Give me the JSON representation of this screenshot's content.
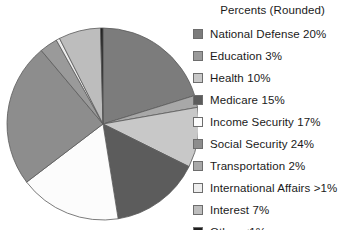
{
  "chart_data": {
    "type": "pie",
    "title": "Percents (Rounded)",
    "xlabel": "",
    "ylabel": "",
    "legend_position": "right",
    "grid": false,
    "start_angle_deg": 0,
    "direction": "clockwise",
    "categories": [
      "National Defense",
      "Education",
      "Health",
      "Medicare",
      "Income Security",
      "Social Security",
      "Transportation",
      "International Affairs",
      "Interest",
      "Other"
    ],
    "values": [
      20,
      3,
      10,
      15,
      17,
      24,
      2,
      0.6,
      7,
      0.4
    ],
    "value_labels": [
      "20%",
      "3%",
      "10%",
      "15%",
      "17%",
      "24%",
      "2%",
      ">1%",
      "7%",
      "<1%"
    ],
    "colors": [
      "#7c7c7c",
      "#9a9a9a",
      "#c8c8c8",
      "#5c5c5c",
      "#fcfcfc",
      "#8d8d8d",
      "#a8a8a8",
      "#ededed",
      "#bdbdbd",
      "#1e1e1e"
    ],
    "slice_order_clockwise": [
      {
        "name": "National Defense",
        "value": 20
      },
      {
        "name": "Transportation",
        "value": 2
      },
      {
        "name": "Health",
        "value": 10
      },
      {
        "name": "Medicare",
        "value": 15
      },
      {
        "name": "Income Security",
        "value": 17
      },
      {
        "name": "Social Security",
        "value": 24
      },
      {
        "name": "Education",
        "value": 3
      },
      {
        "name": "International Affairs",
        "value": 0.6
      },
      {
        "name": "Interest",
        "value": 7
      },
      {
        "name": "Other",
        "value": 0.4
      }
    ]
  },
  "legend": {
    "title": "Percents (Rounded)",
    "items": [
      {
        "label": "National Defense 20%",
        "color": "#7c7c7c"
      },
      {
        "label": "Education 3%",
        "color": "#9a9a9a"
      },
      {
        "label": "Health 10%",
        "color": "#c8c8c8"
      },
      {
        "label": "Medicare 15%",
        "color": "#5c5c5c"
      },
      {
        "label": "Income Security 17%",
        "color": "#fcfcfc"
      },
      {
        "label": "Social Security 24%",
        "color": "#8d8d8d"
      },
      {
        "label": "Transportation 2%",
        "color": "#a8a8a8"
      },
      {
        "label": "International Affairs >1%",
        "color": "#ededed"
      },
      {
        "label": "Interest 7%",
        "color": "#bdbdbd"
      },
      {
        "label": "Other <1%",
        "color": "#1e1e1e"
      }
    ]
  }
}
